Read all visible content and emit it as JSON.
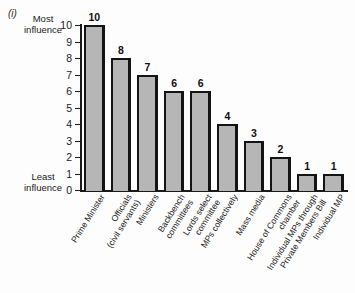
{
  "figure": {
    "index_marker": "(i)",
    "axis_anchor_top": "Most\ninfluence",
    "axis_anchor_bottom": "Least\ninfluence"
  },
  "chart_data": {
    "type": "bar",
    "title": "",
    "subtitle": "",
    "xlabel": "",
    "ylabel": "",
    "ylim": [
      0,
      10
    ],
    "yticks": [
      0,
      1,
      2,
      3,
      4,
      5,
      6,
      7,
      8,
      9,
      10
    ],
    "ytick_labels": [
      "0",
      "1",
      "2",
      "3",
      "4",
      "5",
      "6",
      "7",
      "8",
      "9",
      "10"
    ],
    "grid": false,
    "legend": "none",
    "axis_top_annotation": "Most influence",
    "axis_bottom_annotation": "Least influence",
    "bar_fill_color": "#b6b6b6",
    "bar_edge_color": "#141414",
    "show_value_labels": true,
    "categories": [
      "Prime Minister",
      "Officials\n(civil servants)",
      "Ministers",
      "Backbench\ncommittees",
      "Lords select\ncommittee",
      "MPs collectively",
      "Mass media",
      "House of Commons\nchamber",
      "Individual MPs through\nPrivate Members Bill",
      "Individual MP"
    ],
    "values": [
      10,
      8,
      7,
      6,
      6,
      4,
      3,
      2,
      1,
      1
    ],
    "value_labels": [
      "10",
      "8",
      "7",
      "6",
      "6",
      "4",
      "3",
      "2",
      "1",
      "1"
    ]
  }
}
